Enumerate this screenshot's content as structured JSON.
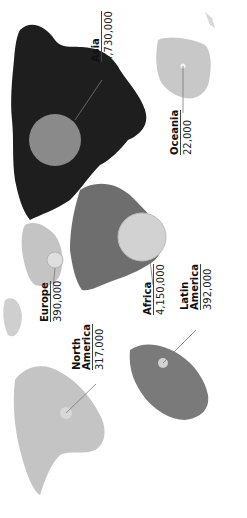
{
  "map": {
    "orientation": "rotated 90 degrees counter-clockwise",
    "colors": {
      "asia": "#1e1e1e",
      "africa": "#6e6e6e",
      "latin_america": "#7a7a7a",
      "europe": "#c4c4c4",
      "north_america": "#c4c4c4",
      "oceania": "#c8c8c8",
      "bubble_dark": "#8a8a8a",
      "bubble_light": "#d2d2d2"
    },
    "regions": [
      {
        "id": "asia",
        "name": "Asia",
        "value": "4,730,000"
      },
      {
        "id": "oceania",
        "name": "Oceania",
        "value": "22,000"
      },
      {
        "id": "africa",
        "name": "Africa",
        "value": "4,150,000"
      },
      {
        "id": "latin_america",
        "name": "Latin America",
        "name_lines": [
          "Latin",
          "America"
        ],
        "value": "392,000"
      },
      {
        "id": "europe",
        "name": "Europe",
        "value": "390,000"
      },
      {
        "id": "north_america",
        "name": "North America",
        "name_lines": [
          "North",
          "America"
        ],
        "value": "317,000"
      }
    ]
  }
}
